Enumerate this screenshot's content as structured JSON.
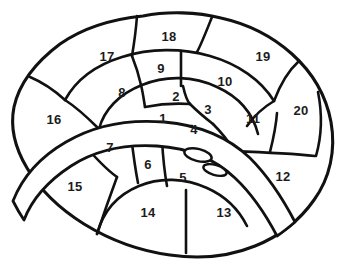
{
  "figure": {
    "kind": "anatomical-plate-diagram",
    "background_color": "#ffffff",
    "line_color": "#111111",
    "label_color": "#1c1c1c"
  },
  "labels": [
    {
      "id": "region-1",
      "text": "1",
      "x": 163,
      "y": 118
    },
    {
      "id": "region-2",
      "text": "2",
      "x": 176,
      "y": 96
    },
    {
      "id": "region-3",
      "text": "3",
      "x": 208,
      "y": 109
    },
    {
      "id": "region-4",
      "text": "4",
      "x": 194,
      "y": 129
    },
    {
      "id": "region-5",
      "text": "5",
      "x": 183,
      "y": 177
    },
    {
      "id": "region-6",
      "text": "6",
      "x": 148,
      "y": 164
    },
    {
      "id": "region-7",
      "text": "7",
      "x": 110,
      "y": 147
    },
    {
      "id": "region-8",
      "text": "8",
      "x": 122,
      "y": 92
    },
    {
      "id": "region-9",
      "text": "9",
      "x": 161,
      "y": 68
    },
    {
      "id": "region-10",
      "text": "10",
      "x": 225,
      "y": 81
    },
    {
      "id": "region-11",
      "text": "11",
      "x": 253,
      "y": 118
    },
    {
      "id": "region-12",
      "text": "12",
      "x": 283,
      "y": 176
    },
    {
      "id": "region-13",
      "text": "13",
      "x": 224,
      "y": 212
    },
    {
      "id": "region-14",
      "text": "14",
      "x": 148,
      "y": 212
    },
    {
      "id": "region-15",
      "text": "15",
      "x": 75,
      "y": 186
    },
    {
      "id": "region-16",
      "text": "16",
      "x": 54,
      "y": 119
    },
    {
      "id": "region-17",
      "text": "17",
      "x": 107,
      "y": 56
    },
    {
      "id": "region-18",
      "text": "18",
      "x": 169,
      "y": 36
    },
    {
      "id": "region-19",
      "text": "19",
      "x": 263,
      "y": 56
    },
    {
      "id": "region-20",
      "text": "20",
      "x": 301,
      "y": 110
    }
  ]
}
